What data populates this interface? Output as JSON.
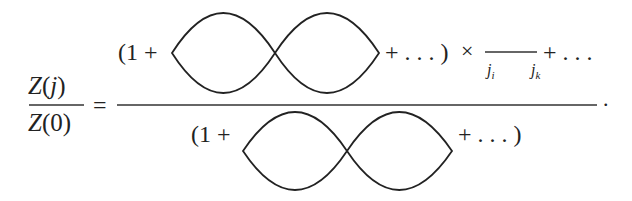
{
  "equation": {
    "lhs": {
      "numerator": "ℤ(j)",
      "numerator_script": "Z",
      "numerator_arg": "(j)",
      "denominator_script": "Z",
      "denominator_arg": "(0)",
      "equals": "="
    },
    "rhs": {
      "numerator": {
        "open": "(1 +",
        "diagram": "figure-eight-vacuum-bubble",
        "tail": "+ . . . )",
        "times": "×",
        "propagator": "propagator-line",
        "label_start": "j",
        "label_start_sub": "i",
        "label_end": "j",
        "label_end_sub": "k",
        "trailing": "+ . . ."
      },
      "denominator": {
        "open": "(1 +",
        "diagram": "figure-eight-vacuum-bubble",
        "tail": "+ . . . )"
      }
    },
    "terminator": "."
  }
}
